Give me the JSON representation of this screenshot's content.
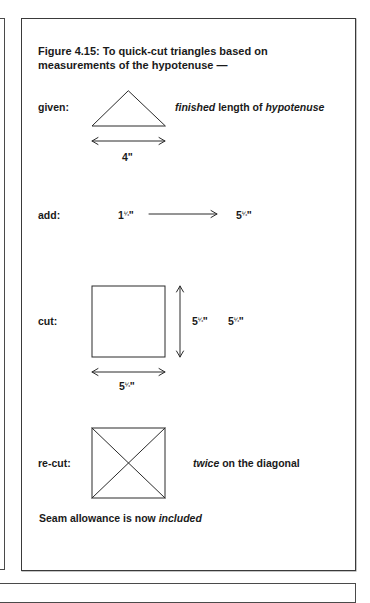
{
  "figure": {
    "title_line1": "Figure 4.15: To quick-cut triangles based on",
    "title_line2": "measurements of the hypotenuse —"
  },
  "steps": {
    "given": {
      "label": "given:",
      "note_italic_1": "finished",
      "note_mid": " length of ",
      "note_italic_2": "hypotenuse",
      "dimension": "4\""
    },
    "add": {
      "label": "add:",
      "from_whole": "1",
      "from_fraction": "¼",
      "to_whole": "5",
      "to_fraction": "¼",
      "inch_mark": "\""
    },
    "cut": {
      "label": "cut:",
      "side_whole": "5",
      "side_fraction": "¼",
      "repeat_whole": "5",
      "repeat_fraction": "¼",
      "bottom_whole": "5",
      "bottom_fraction": "¼",
      "inch_mark": "\""
    },
    "recut": {
      "label": "re-cut:",
      "note_italic": "twice",
      "note_rest": " on the diagonal"
    }
  },
  "footer": {
    "text_plain": "Seam allowance is now ",
    "text_italic": "included"
  },
  "colors": {
    "line": "#2a2a2a",
    "border": "#3a3a3a",
    "text": "#1a1a1a"
  }
}
